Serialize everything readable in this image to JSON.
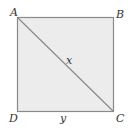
{
  "diagram": {
    "type": "square-with-diagonal",
    "vertices": {
      "A": {
        "label": "A",
        "position": "top-left"
      },
      "B": {
        "label": "B",
        "position": "top-right"
      },
      "C": {
        "label": "C",
        "position": "bottom-right"
      },
      "D": {
        "label": "D",
        "position": "bottom-left"
      }
    },
    "diagonal": {
      "from": "A",
      "to": "C",
      "label": "x"
    },
    "side": {
      "from": "D",
      "to": "C",
      "label": "y"
    },
    "colors": {
      "fill": "#ececec",
      "stroke": "#8a8a8a",
      "text": "#333333"
    }
  }
}
